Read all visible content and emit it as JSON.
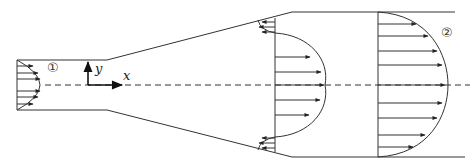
{
  "diagram": {
    "type": "pipe-flow-expansion",
    "colors": {
      "line": "#333333",
      "background": "#ffffff"
    },
    "axes": {
      "x_label": "x",
      "y_label": "y"
    },
    "sections": [
      {
        "id": "section-1",
        "label": "①",
        "profile": "parabolic-forward",
        "arrow_count": 6
      },
      {
        "id": "section-mid",
        "label": "",
        "profile": "separated-with-backflow",
        "arrow_count_forward": 5,
        "arrow_count_backflow_top": 3,
        "arrow_count_backflow_bottom": 3
      },
      {
        "id": "section-2",
        "label": "②",
        "profile": "parabolic-forward",
        "arrow_count": 10
      }
    ]
  }
}
